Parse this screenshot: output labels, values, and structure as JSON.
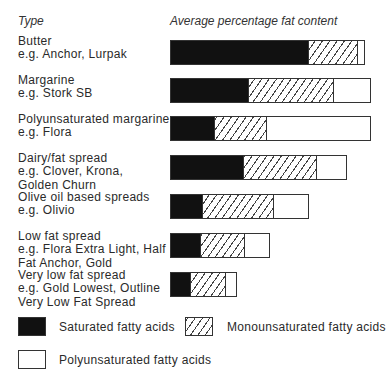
{
  "chart_data": {
    "type": "bar",
    "orientation": "horizontal",
    "stacked": true,
    "title": "",
    "column_headers": {
      "type": "Type",
      "value": "Average percentage fat content"
    },
    "categories": [
      "Butter e.g. Anchor, Lurpak",
      "Margarine e.g. Stork SB",
      "Polyunsaturated margarine e.g. Flora",
      "Dairy/fat spread e.g. Clover, Krona, Golden Churn",
      "Olive oil based spreads e.g. Olivio",
      "Low fat spread e.g. Flora Extra Light, Half Fat Anchor, Gold",
      "Very low fat spread e.g. Gold Lowest, Outline Very Low Fat Spread"
    ],
    "series": [
      {
        "name": "Saturated fatty acids",
        "fill": "solid-black",
        "values": [
          57,
          32,
          18,
          30,
          13,
          12,
          8
        ]
      },
      {
        "name": "Monounsaturated fatty acids",
        "fill": "hatched",
        "values": [
          21,
          36,
          22,
          31,
          30,
          19,
          15
        ]
      },
      {
        "name": "Polyunsaturated fatty acids",
        "fill": "white",
        "values": [
          2.5,
          15,
          43,
          12,
          14,
          10,
          4
        ]
      }
    ],
    "xlabel": "",
    "ylabel": "",
    "axis_ticks": false,
    "grid": false,
    "legend_position": "bottom"
  },
  "header": {
    "type": "Type",
    "value": "Average percentage fat content"
  },
  "rows": [
    {
      "lines": [
        "Butter",
        "e.g. Anchor, Lurpak"
      ]
    },
    {
      "lines": [
        "Margarine",
        "e.g. Stork SB"
      ]
    },
    {
      "lines": [
        "Polyunsaturated margarine",
        "e.g. Flora"
      ]
    },
    {
      "lines": [
        "Dairy/fat spread",
        "e.g. Clover, Krona,",
        "Golden Churn"
      ]
    },
    {
      "lines": [
        "Olive oil based spreads",
        "e.g. Olivio"
      ]
    },
    {
      "lines": [
        "Low fat spread",
        "e.g. Flora Extra Light, Half",
        "Fat Anchor, Gold"
      ]
    },
    {
      "lines": [
        "Very low fat spread",
        "e.g. Gold Lowest, Outline",
        "Very Low Fat Spread"
      ]
    }
  ],
  "legend": {
    "saturated": "Saturated fatty acids",
    "mono": "Monounsaturated fatty acids",
    "poly": "Polyunsaturated fatty acids"
  },
  "colors": {
    "saturated": "#111111",
    "hatch": "#444444",
    "outline": "#333333"
  }
}
